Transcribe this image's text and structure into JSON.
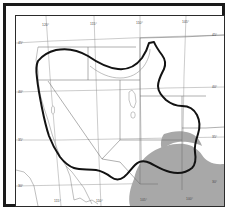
{
  "figure": {
    "background_color": "#ffffff",
    "frame_color": "#1a1a1a",
    "neatline_color": "#2b2b2b"
  },
  "legend_colors": {
    "range_boundary": "#121212",
    "shaded_region": "#a8a8a8",
    "state_border": "#6e6e6e",
    "graticule": "#8c8c8c",
    "coastline": "#8a8a8a",
    "lake_fill": "#ffffff"
  },
  "graticule": {
    "latitude_labels": [
      "45°",
      "40°",
      "35°",
      "30°"
    ],
    "longitude_labels": [
      "120°",
      "115°",
      "110°",
      "105°",
      "100°"
    ],
    "left_ticks": [
      {
        "label": "45°",
        "x": 5,
        "y": 26
      },
      {
        "label": "40°",
        "x": 5,
        "y": 74
      },
      {
        "label": "35°",
        "x": 5,
        "y": 122
      },
      {
        "label": "30°",
        "x": 5,
        "y": 166
      }
    ],
    "right_ticks": [
      {
        "label": "45°",
        "x": 192,
        "y": 23
      },
      {
        "label": "40°",
        "x": 192,
        "y": 72
      },
      {
        "label": "35°",
        "x": 192,
        "y": 120
      },
      {
        "label": "30°",
        "x": 192,
        "y": 164
      }
    ],
    "top_ticks": [
      {
        "label": "120°",
        "x": 34,
        "y": 9
      },
      {
        "label": "115°",
        "x": 84,
        "y": 9
      },
      {
        "label": "110°",
        "x": 128,
        "y": 9
      },
      {
        "label": "105°",
        "x": 172,
        "y": 9
      }
    ],
    "bottom_ticks": [
      {
        "label": "115°",
        "x": 42,
        "y": 182
      },
      {
        "label": "110°",
        "x": 84,
        "y": 182
      },
      {
        "label": "105°",
        "x": 128,
        "y": 182
      },
      {
        "label": "100°",
        "x": 176,
        "y": 182
      }
    ]
  },
  "map_features": {
    "range_boundary_name": "distribution-boundary",
    "shaded_region_name": "shaded-distribution-area",
    "lake_name": "great-salt-lake",
    "small-lake_name": "utah-lake"
  }
}
